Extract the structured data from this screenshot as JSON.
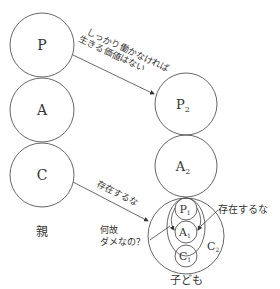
{
  "parent": {
    "label": "親",
    "circles": [
      {
        "id": "P",
        "label": "P"
      },
      {
        "id": "A",
        "label": "A"
      },
      {
        "id": "C",
        "label": "C"
      }
    ]
  },
  "child": {
    "label": "子ども",
    "circles": [
      {
        "id": "P2",
        "label": "P",
        "sub": "2"
      },
      {
        "id": "A2",
        "label": "A",
        "sub": "2"
      }
    ],
    "inner": {
      "container_label": "C",
      "container_sub": "2",
      "circles": [
        {
          "id": "P1",
          "label": "P",
          "sub": "1"
        },
        {
          "id": "A1",
          "label": "A",
          "sub": "1"
        },
        {
          "id": "C1",
          "label": "C",
          "sub": "1"
        }
      ]
    }
  },
  "messages": {
    "work_line1": "しっかり働かなければ",
    "work_line2": "生きる価値はない",
    "dont_exist_arrow": "存在するな",
    "dont_exist_side": "存在するな",
    "why_line1": "何故",
    "why_line2": "ダメなの？"
  }
}
